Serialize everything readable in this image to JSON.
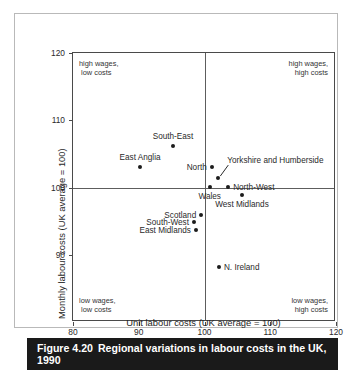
{
  "caption": {
    "number": "Figure 4.20",
    "text": "Regional variations in labour costs in the UK, 1990"
  },
  "chart_data": {
    "type": "scatter",
    "title": "Regional variations in labour costs in the UK, 1990",
    "xlabel": "Unit labour costs (UK average = 100)",
    "ylabel": "Monthly labour costs (UK average = 100)",
    "xlim": [
      80,
      120
    ],
    "ylim": [
      80,
      120
    ],
    "xticks": [
      80,
      90,
      100,
      110,
      120
    ],
    "yticks": [
      90,
      100,
      110,
      120
    ],
    "grid": false,
    "legend": "none",
    "reference_lines": {
      "x": 100,
      "y": 100
    },
    "points": [
      {
        "label": "South-East",
        "x": 95.2,
        "y": 106.2,
        "label_pos": "above"
      },
      {
        "label": "East Anglia",
        "x": 90.2,
        "y": 103.1,
        "label_pos": "above"
      },
      {
        "label": "North",
        "x": 101.1,
        "y": 103.1,
        "label_pos": "left"
      },
      {
        "label": "Yorkshire and Humberside",
        "x": 102.1,
        "y": 101.4,
        "label_pos": "leader"
      },
      {
        "label": "North-West",
        "x": 103.6,
        "y": 100.1,
        "label_pos": "right"
      },
      {
        "label": "Wales",
        "x": 100.8,
        "y": 100.1,
        "label_pos": "below"
      },
      {
        "label": "West Midlands",
        "x": 105.7,
        "y": 98.9,
        "label_pos": "below"
      },
      {
        "label": "Scotland",
        "x": 99.5,
        "y": 95.9,
        "label_pos": "left"
      },
      {
        "label": "South-West",
        "x": 98.4,
        "y": 94.9,
        "label_pos": "left"
      },
      {
        "label": "East Midlands",
        "x": 98.7,
        "y": 93.7,
        "label_pos": "left"
      },
      {
        "label": "N. Ireland",
        "x": 102.2,
        "y": 88.2,
        "label_pos": "right"
      }
    ],
    "annotations": [
      {
        "position": "top-left",
        "text": "high wages,\n low costs"
      },
      {
        "position": "top-right",
        "text": "high wages,\nhigh costs"
      },
      {
        "position": "bottom-left",
        "text": "low wages,\n low costs"
      },
      {
        "position": "bottom-right",
        "text": "low wages,\nhigh costs"
      }
    ]
  },
  "colors": {
    "point": "#1c1c1c",
    "axis": "#4a4a4a",
    "caption_bar": "#1a1a1a",
    "caption_text": "#ffffff",
    "frame": "#b9b9b9"
  }
}
